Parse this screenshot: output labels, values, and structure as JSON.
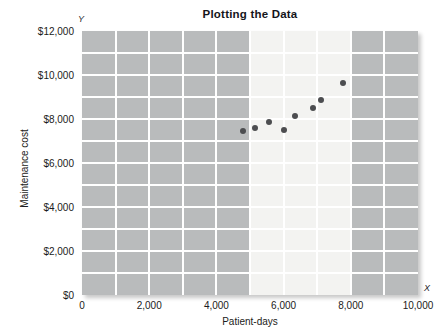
{
  "chart_data": {
    "type": "scatter",
    "title": "Plotting the Data",
    "xlabel": "Patient-days",
    "ylabel": "Maintenance cost",
    "xlim": [
      0,
      10000
    ],
    "ylim": [
      0,
      12000
    ],
    "grid": true,
    "legend": null,
    "axis_marker_x": "X",
    "axis_marker_y": "Y",
    "xticks": [
      {
        "value": 0,
        "label": "0"
      },
      {
        "value": 2000,
        "label": "2,000"
      },
      {
        "value": 4000,
        "label": "4,000"
      },
      {
        "value": 6000,
        "label": "6,000"
      },
      {
        "value": 8000,
        "label": "8,000"
      },
      {
        "value": 10000,
        "label": "10,000"
      }
    ],
    "yticks": [
      {
        "value": 0,
        "label": "$0"
      },
      {
        "value": 2000,
        "label": "$2,000"
      },
      {
        "value": 4000,
        "label": "$4,000"
      },
      {
        "value": 6000,
        "label": "$6,000"
      },
      {
        "value": 8000,
        "label": "$8,000"
      },
      {
        "value": 10000,
        "label": "$10,000"
      },
      {
        "value": 12000,
        "label": "$12,000"
      }
    ],
    "gridlines_x_step": 1000,
    "gridlines_y_step": 1000,
    "highlight_band": {
      "x_start": 5000,
      "x_end": 8000
    },
    "points": [
      {
        "x": 4800,
        "y": 7450
      },
      {
        "x": 5150,
        "y": 7600
      },
      {
        "x": 5560,
        "y": 7870
      },
      {
        "x": 6000,
        "y": 7500
      },
      {
        "x": 6330,
        "y": 8130
      },
      {
        "x": 6870,
        "y": 8520
      },
      {
        "x": 7110,
        "y": 8880
      },
      {
        "x": 7760,
        "y": 9620
      }
    ],
    "colors": {
      "plot_background": "#b9bbbc",
      "highlight_band": "#f3f3f1",
      "gridline": "#ffffff",
      "point": "#4c4d50",
      "text": "#1b1b20"
    }
  }
}
